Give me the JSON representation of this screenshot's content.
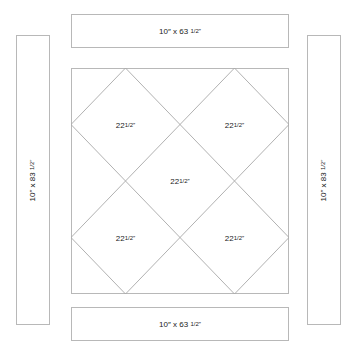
{
  "borders": {
    "top": {
      "size": "10″ x 63",
      "frac": "1/2″"
    },
    "bottom": {
      "size": "10″ x 63",
      "frac": "1/2″"
    },
    "left": {
      "size": "10″ x 83",
      "frac": "1/2″"
    },
    "right": {
      "size": "10″ x 83",
      "frac": "1/2″"
    }
  },
  "blocks": [
    {
      "whole": "22",
      "frac": "1/2″",
      "position": "upper-left"
    },
    {
      "whole": "22",
      "frac": "1/2″",
      "position": "upper-right"
    },
    {
      "whole": "22",
      "frac": "1/2″",
      "position": "center"
    },
    {
      "whole": "22",
      "frac": "1/2″",
      "position": "lower-left"
    },
    {
      "whole": "22",
      "frac": "1/2″",
      "position": "lower-right"
    }
  ],
  "colors": {
    "line": "#b0b0b0",
    "text": "#222222"
  }
}
